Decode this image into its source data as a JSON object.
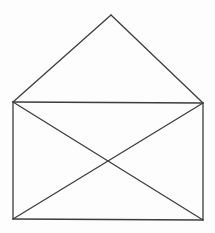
{
  "figure": {
    "background_color": "#fdfdfd",
    "stroke_color": "#3d3d3d",
    "stroke_width": 1.3,
    "canvas": {
      "width": 215,
      "height": 233
    },
    "vertices": {
      "apex": [
        111,
        15
      ],
      "rect_top_left": [
        13,
        102
      ],
      "rect_top_right": [
        203,
        103
      ],
      "rect_bottom_left": [
        13,
        219
      ],
      "rect_bottom_right": [
        203,
        220
      ]
    },
    "edges": [
      {
        "name": "flap-left-edge",
        "from": "apex",
        "to": "rect_top_left"
      },
      {
        "name": "flap-right-edge",
        "from": "apex",
        "to": "rect_top_right"
      },
      {
        "name": "rect-top-edge",
        "from": "rect_top_left",
        "to": "rect_top_right"
      },
      {
        "name": "rect-left-edge",
        "from": "rect_top_left",
        "to": "rect_bottom_left"
      },
      {
        "name": "rect-right-edge",
        "from": "rect_top_right",
        "to": "rect_bottom_right"
      },
      {
        "name": "rect-bottom-edge",
        "from": "rect_bottom_left",
        "to": "rect_bottom_right"
      },
      {
        "name": "diagonal-tl-br",
        "from": "rect_top_left",
        "to": "rect_bottom_right"
      },
      {
        "name": "diagonal-tr-bl",
        "from": "rect_top_right",
        "to": "rect_bottom_left"
      }
    ]
  }
}
